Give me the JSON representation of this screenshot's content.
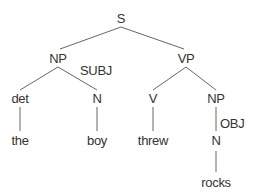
{
  "tree": {
    "root": "S",
    "nodes": {
      "s": "S",
      "np_subj": "NP",
      "vp": "VP",
      "det": "det",
      "n_boy": "N",
      "v": "V",
      "np_obj": "NP",
      "n_rocks": "N",
      "w_the": "the",
      "w_boy": "boy",
      "w_threw": "threw",
      "w_rocks": "rocks"
    },
    "functions": {
      "subj": "SUBJ",
      "obj": "OBJ"
    },
    "edges": [
      [
        "S",
        "NP"
      ],
      [
        "S",
        "VP"
      ],
      [
        "NP",
        "det"
      ],
      [
        "NP",
        "N"
      ],
      [
        "VP",
        "V"
      ],
      [
        "VP",
        "NP"
      ],
      [
        "det",
        "the"
      ],
      [
        "N",
        "boy"
      ],
      [
        "V",
        "threw"
      ],
      [
        "NP",
        "N"
      ],
      [
        "N",
        "rocks"
      ]
    ],
    "line_color": "#555555"
  }
}
